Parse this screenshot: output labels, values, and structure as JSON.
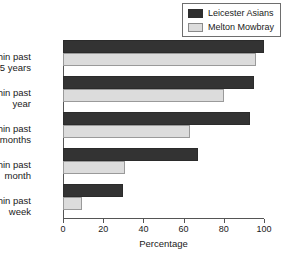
{
  "chart_data": {
    "type": "bar",
    "orientation": "horizontal",
    "title": "",
    "xlabel": "Percentage",
    "ylabel": "",
    "xlim": [
      0,
      100
    ],
    "xticks": [
      0,
      20,
      40,
      60,
      80,
      100
    ],
    "grid": false,
    "legend_position": "top-right",
    "categories": [
      "Within past 5 years",
      "Within past year",
      "Within past 6 months",
      "Within past month",
      "Within past week"
    ],
    "category_lines": [
      [
        "Within past",
        "5 years"
      ],
      [
        "Within past",
        "year"
      ],
      [
        "Within past",
        "6 months"
      ],
      [
        "Within past",
        "month"
      ],
      [
        "Within past",
        "week"
      ]
    ],
    "series": [
      {
        "name": "Leicester Asians",
        "color": "#333333",
        "values": [
          100,
          95,
          93,
          67,
          30
        ]
      },
      {
        "name": "Melton Mowbray",
        "color": "#dcdcdc",
        "values": [
          96,
          80,
          63,
          31,
          9.5
        ]
      }
    ]
  },
  "legend": {
    "items": [
      {
        "label": "Leicester Asians",
        "swatch": "dark"
      },
      {
        "label": "Melton Mowbray",
        "swatch": "light"
      }
    ]
  },
  "axis": {
    "x_label": "Percentage",
    "tick_labels": [
      "0",
      "20",
      "40",
      "60",
      "80",
      "100"
    ]
  },
  "colors": {
    "series_dark": "#333333",
    "series_light": "#dcdcdc",
    "axis": "#555555",
    "text": "#1a1a1a"
  }
}
